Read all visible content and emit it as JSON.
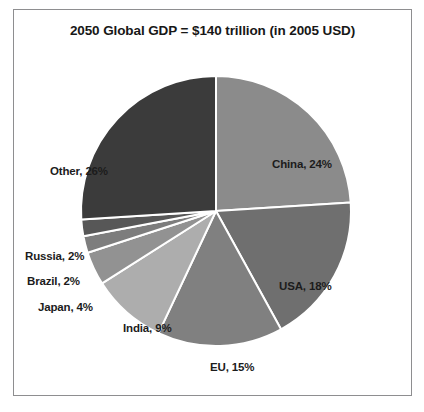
{
  "chart_data": {
    "type": "pie",
    "title": "2050 Global GDP = $140 trillion (in 2005 USD)",
    "total_label": "$140 trillion",
    "units": "2005 USD",
    "year": "2050",
    "categories": [
      "China",
      "USA",
      "EU",
      "India",
      "Japan",
      "Brazil",
      "Russia",
      "Other"
    ],
    "values": [
      24,
      18,
      15,
      9,
      4,
      2,
      2,
      26
    ],
    "value_suffix": "%",
    "start_angle_deg": 0,
    "direction": "clockwise",
    "legend": "none",
    "labels": [
      {
        "name": "China",
        "text": "China, 24%",
        "value": 24,
        "color": "#8b8b8b",
        "x": 258,
        "y": 148,
        "placement": "inside"
      },
      {
        "name": "USA",
        "text": "USA, 18%",
        "value": 18,
        "color": "#6f6f6f",
        "x": 265,
        "y": 270,
        "placement": "inside"
      },
      {
        "name": "EU",
        "text": "EU, 15%",
        "value": 15,
        "color": "#808080",
        "x": 196,
        "y": 351,
        "placement": "inside"
      },
      {
        "name": "India",
        "text": "India, 9%",
        "value": 9,
        "color": "#adadad",
        "x": 109,
        "y": 312,
        "placement": "inside"
      },
      {
        "name": "Japan",
        "text": "Japan, 4%",
        "value": 4,
        "color": "#929292",
        "x": 24,
        "y": 291,
        "placement": "outside"
      },
      {
        "name": "Brazil",
        "text": "Brazil, 2%",
        "value": 2,
        "color": "#7d7d7d",
        "x": 13,
        "y": 265,
        "placement": "outside"
      },
      {
        "name": "Russia",
        "text": "Russia, 2%",
        "value": 2,
        "color": "#575757",
        "x": 11,
        "y": 240,
        "placement": "outside"
      },
      {
        "name": "Other",
        "text": "Other, 26%",
        "value": 26,
        "color": "#3b3b3b",
        "x": 36,
        "y": 155,
        "placement": "outside"
      }
    ],
    "geometry": {
      "center_x": 202,
      "center_y": 201,
      "radius": 135,
      "slice_border_color": "#ffffff",
      "slice_border_width": 2
    },
    "background": "#ffffff",
    "frame_border_color": "#8e8e90"
  }
}
